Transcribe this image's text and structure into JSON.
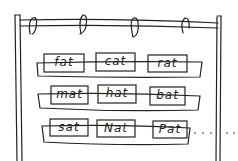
{
  "illustration": "pocket chart with word cards",
  "rows": [
    {
      "cards": [
        "fat",
        "cat",
        "rat"
      ]
    },
    {
      "cards": [
        "mat",
        "hat",
        "bat"
      ]
    },
    {
      "cards": [
        "sat",
        "Nat",
        "Pat"
      ]
    }
  ],
  "trailing": "....",
  "colors": {
    "ink": "#222222",
    "background": "#ffffff"
  }
}
